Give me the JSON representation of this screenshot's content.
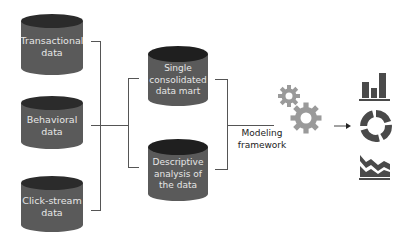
{
  "diagram": {
    "colors": {
      "cylinder_body": "#5a5a5a",
      "cylinder_top": "#2b2b2b",
      "cylinder_text": "#e6e6e6",
      "connector": "#555555",
      "gear": "#9a9a9a",
      "icon": "#4a4a4a"
    },
    "sources": [
      {
        "label": "Transactional\ndata"
      },
      {
        "label": "Behavioral\ndata"
      },
      {
        "label": "Click-stream\ndata"
      }
    ],
    "intermediate": [
      {
        "label": "Single\nconsolidated\ndata mart"
      },
      {
        "label": "Descriptive\nanalysis of\nthe data"
      }
    ],
    "process": {
      "label": "Modeling\nframework",
      "icon": "gears-icon"
    },
    "outputs": [
      {
        "icon": "bar-chart-icon"
      },
      {
        "icon": "donut-chart-icon"
      },
      {
        "icon": "area-chart-icon"
      }
    ]
  }
}
